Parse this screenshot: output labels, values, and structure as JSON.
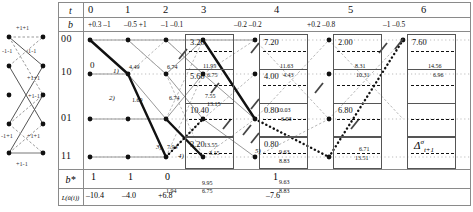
{
  "figure": {
    "type": "trellis-diagram"
  },
  "state_diagram": {
    "name": "state-transition-diagram",
    "edge_labels": [
      "+1+1",
      "-1-1",
      "-1-1",
      "+1+1",
      "+1-1",
      "-1+1",
      "+1+1",
      "+1-1"
    ]
  },
  "table": {
    "row_headers": {
      "t": "t",
      "b": "b",
      "b_star": "b*",
      "L": "L(û(i))"
    },
    "t_values": [
      "0",
      "1",
      "2",
      "3",
      "4",
      "5",
      "6"
    ],
    "b_pairs": [
      "+0.3 –1",
      "–0.5 +1",
      "–1 –0.1",
      "–0.2 –0.2",
      "+0.2 –0.8",
      "–1 –0.5"
    ],
    "states": [
      "00",
      "10",
      "01",
      "11"
    ],
    "b_star_values": [
      "1",
      "1",
      "0",
      "1"
    ],
    "L_values": [
      "–10.4",
      "–4.0",
      "+6.8",
      "–7.6"
    ],
    "delta_label_base": "Δ",
    "delta_label_sup": "σ",
    "delta_label_sub": "t+1"
  },
  "boxes": [
    {
      "name": "delta-box-1",
      "values": [
        "3.20",
        "5.60",
        "10.40",
        "3.20"
      ]
    },
    {
      "name": "delta-box-2",
      "values": [
        "7.20",
        "4.00",
        "0.80",
        "0.80"
      ]
    },
    {
      "name": "delta-box-3",
      "values": [
        "2.00",
        "",
        "6.80",
        ""
      ]
    },
    {
      "name": "delta-box-4",
      "values": [
        "7.60",
        "",
        "",
        "DELTA"
      ]
    }
  ],
  "path_labels": [
    {
      "text": "1)",
      "x": 30,
      "y": 36
    },
    {
      "text": "2)",
      "x": 26,
      "y": 63
    },
    {
      "text": "3)",
      "x": 73,
      "y": 112
    },
    {
      "text": "4)",
      "x": 95,
      "y": 121
    },
    {
      "text": "5)",
      "x": 172,
      "y": 116
    }
  ],
  "node_metrics": [
    {
      "text": "0",
      "x": 7,
      "y": 29,
      "size": 9
    },
    {
      "text": "4.49",
      "x": 46,
      "y": 33
    },
    {
      "text": "6.74",
      "x": 84,
      "y": 33
    },
    {
      "text": "11.95",
      "x": 120,
      "y": 32
    },
    {
      "text": "6.75",
      "x": 124,
      "y": 41
    },
    {
      "text": "1.69",
      "x": 49,
      "y": 66
    },
    {
      "text": "6.74",
      "x": 86,
      "y": 64
    },
    {
      "text": "7.55",
      "x": 122,
      "y": 62
    },
    {
      "text": "13.15",
      "x": 124,
      "y": 70
    },
    {
      "text": "7.94",
      "x": 84,
      "y": 113
    },
    {
      "text": "13.55",
      "x": 121,
      "y": 111
    },
    {
      "text": "3.15",
      "x": 126,
      "y": 119
    },
    {
      "text": "1.94",
      "x": 83,
      "y": 157
    },
    {
      "text": "9.95",
      "x": 119,
      "y": 149
    },
    {
      "text": "6.75",
      "x": 119,
      "y": 157
    },
    {
      "text": "11.63",
      "x": 197,
      "y": 32
    },
    {
      "text": "4.43",
      "x": 200,
      "y": 41
    },
    {
      "text": "10.03",
      "x": 194,
      "y": 76
    },
    {
      "text": "6.03",
      "x": 198,
      "y": 85
    },
    {
      "text": "9.63",
      "x": 196,
      "y": 118
    },
    {
      "text": "8.83",
      "x": 196,
      "y": 127
    },
    {
      "text": "9.63",
      "x": 196,
      "y": 148
    },
    {
      "text": "8.83",
      "x": 196,
      "y": 157
    },
    {
      "text": "8.31",
      "x": 272,
      "y": 32
    },
    {
      "text": "10.31",
      "x": 273,
      "y": 41
    },
    {
      "text": "6.71",
      "x": 276,
      "y": 115
    },
    {
      "text": "13.51",
      "x": 272,
      "y": 124
    },
    {
      "text": "14.56",
      "x": 345,
      "y": 32
    },
    {
      "text": "6.96",
      "x": 350,
      "y": 41
    }
  ]
}
